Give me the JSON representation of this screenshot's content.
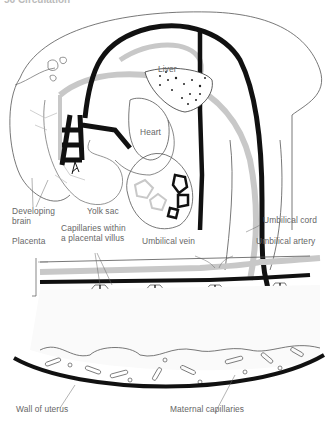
{
  "header": {
    "text": "56 Circulation"
  },
  "diagram": {
    "colors": {
      "artery": "#111111",
      "vein": "#c8c8c8",
      "outline": "#555555",
      "label": "#666666"
    },
    "labels": {
      "liver": "Liver",
      "heart": "Heart",
      "developing_brain_1": "Developing",
      "developing_brain_2": "brain",
      "yolk_sac": "Yolk sac",
      "umbilical_cord": "Umbilical cord",
      "placenta": "Placenta",
      "capillaries_1": "Capillaries within",
      "capillaries_2": "a placental villus",
      "umbilical_vein": "Umbilical vein",
      "umbilical_artery": "Umbilical artery",
      "wall_of_uterus": "Wall of uterus",
      "maternal_capillaries": "Maternal capillaries"
    }
  }
}
